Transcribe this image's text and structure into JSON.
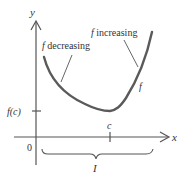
{
  "diagram": {
    "axes": {
      "x_label": "x",
      "y_label": "y",
      "origin_label": "0"
    },
    "labels": {
      "f_decreasing_f": "f",
      "f_decreasing_text": " decreasing",
      "f_increasing_f": "f",
      "f_increasing_text": " increasing",
      "curve_label": "f",
      "fc_label": "f(c)",
      "c_label": "c",
      "interval_label": "I"
    },
    "colors": {
      "curve": "#5a5a5a",
      "axes": "#555555",
      "text": "#333333"
    }
  }
}
